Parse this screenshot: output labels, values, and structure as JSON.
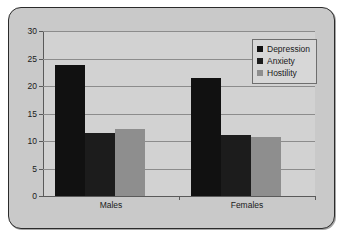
{
  "chart_data": {
    "type": "bar",
    "title": "",
    "xlabel": "",
    "ylabel": "",
    "categories": [
      "Males",
      "Females"
    ],
    "series": [
      {
        "name": "Depression",
        "color": "#111111",
        "values": [
          23.9,
          21.4
        ]
      },
      {
        "name": "Anxiety",
        "color": "#1c1c1c",
        "values": [
          11.5,
          11.1
        ]
      },
      {
        "name": "Hostility",
        "color": "#8e8e8e",
        "values": [
          12.2,
          10.7
        ]
      }
    ],
    "ylim": [
      0,
      30
    ],
    "ytick_labels": [
      "0",
      "5",
      "10",
      "15",
      "20",
      "25",
      "30"
    ],
    "ytick_values": [
      0,
      5,
      10,
      15,
      20,
      25,
      30
    ],
    "grid": true,
    "legend_position": "top-right"
  },
  "legend": {
    "entries": [
      {
        "label": "Depression"
      },
      {
        "label": "Anxiety"
      },
      {
        "label": "Hostility"
      }
    ]
  },
  "colors": {
    "frame_border": "#2b2b2b",
    "frame_background": "#c9c9c9",
    "plot_background": "#d2d2d2",
    "gridline": "#8c8c8c",
    "axis": "#5a5a5a",
    "text": "#1a1a1a"
  }
}
